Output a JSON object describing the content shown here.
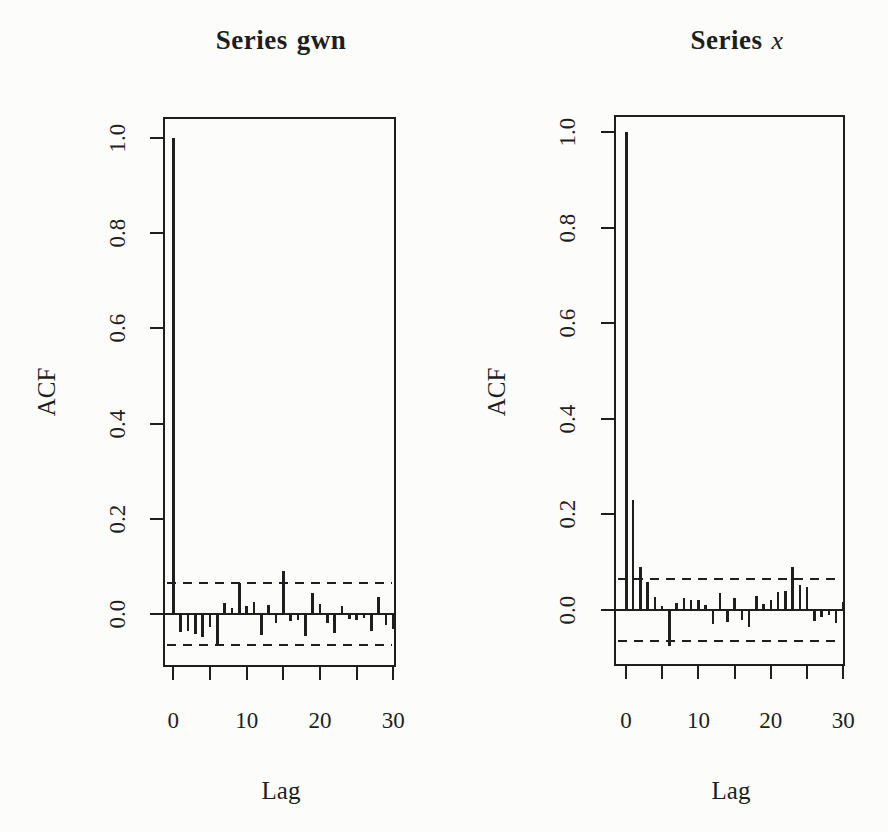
{
  "page": {
    "background": "#fcfcfa",
    "ink_color": "#1e1e1e"
  },
  "chart_data": [
    {
      "type": "bar",
      "title": "Series gwn",
      "title_parts": {
        "prefix": "Series",
        "series": "gwn",
        "series_italic": false
      },
      "xlabel": "Lag",
      "ylabel": "ACF",
      "x": [
        0,
        1,
        2,
        3,
        4,
        5,
        6,
        7,
        8,
        9,
        10,
        11,
        12,
        13,
        14,
        15,
        16,
        17,
        18,
        19,
        20,
        21,
        22,
        23,
        24,
        25,
        26,
        27,
        28,
        29,
        30
      ],
      "values": [
        1.0,
        -0.038,
        -0.035,
        -0.042,
        -0.048,
        -0.028,
        -0.062,
        0.023,
        0.013,
        0.065,
        0.016,
        0.025,
        -0.044,
        0.018,
        -0.019,
        0.091,
        -0.014,
        -0.012,
        -0.047,
        0.044,
        0.02,
        -0.019,
        -0.04,
        0.016,
        -0.011,
        -0.013,
        -0.008,
        -0.035,
        0.035,
        -0.024,
        -0.031
      ],
      "confidence_band": 0.065,
      "confidence_band_style": "dashed",
      "ylim": [
        -0.11,
        1.04
      ],
      "xlim": [
        -1.4,
        31.4
      ],
      "yticks": [
        0.0,
        0.2,
        0.4,
        0.6,
        0.8,
        1.0
      ],
      "ytick_labels": [
        "0.0",
        "0.2",
        "0.4",
        "0.6",
        "0.8",
        "1.0"
      ],
      "xticks": [
        0,
        5,
        10,
        15,
        20,
        25,
        30
      ],
      "xtick_labels": [
        "0",
        "",
        "10",
        "",
        "20",
        "",
        "30"
      ],
      "grid": false,
      "legend": "none"
    },
    {
      "type": "bar",
      "title": "Series x",
      "title_parts": {
        "prefix": "Series",
        "series": "x",
        "series_italic": true
      },
      "xlabel": "Lag",
      "ylabel": "ACF",
      "x": [
        0,
        1,
        2,
        3,
        4,
        5,
        6,
        7,
        8,
        9,
        10,
        11,
        12,
        13,
        14,
        15,
        16,
        17,
        18,
        19,
        20,
        21,
        22,
        23,
        24,
        25,
        26,
        27,
        28,
        29,
        30
      ],
      "values": [
        1.0,
        0.23,
        0.09,
        0.058,
        0.028,
        0.008,
        -0.075,
        0.015,
        0.025,
        0.021,
        0.02,
        0.01,
        -0.03,
        0.035,
        -0.026,
        0.025,
        -0.02,
        -0.035,
        0.03,
        0.012,
        0.02,
        0.038,
        0.04,
        0.091,
        0.052,
        0.049,
        -0.024,
        -0.014,
        -0.01,
        -0.028,
        0.017
      ],
      "confidence_band": 0.065,
      "confidence_band_style": "dashed",
      "ylim": [
        -0.11,
        1.04
      ],
      "xlim": [
        -1.4,
        31.4
      ],
      "yticks": [
        0.0,
        0.2,
        0.4,
        0.6,
        0.8,
        1.0
      ],
      "ytick_labels": [
        "0.0",
        "0.2",
        "0.4",
        "0.6",
        "0.8",
        "1.0"
      ],
      "xticks": [
        0,
        5,
        10,
        15,
        20,
        25,
        30
      ],
      "xtick_labels": [
        "0",
        "",
        "10",
        "",
        "20",
        "",
        "30"
      ],
      "grid": false,
      "legend": "none"
    }
  ]
}
